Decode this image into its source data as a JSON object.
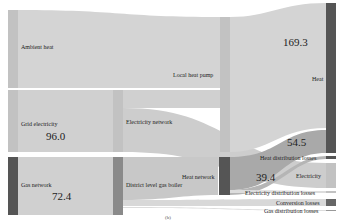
{
  "figure": {
    "caption": "(b)",
    "type": "sankey"
  },
  "colors": {
    "flow": "#d2d2d2",
    "flow_dark": "#a8a8a8",
    "node_light": "#c4c4c4",
    "node_dark": "#555555",
    "node_mid": "#8a8a8a",
    "background": "#ffffff"
  },
  "nodes": {
    "ambient_heat": {
      "label": "Ambient heat"
    },
    "grid_electricity": {
      "label": "Grid electricity",
      "value": "96.0"
    },
    "gas_network": {
      "label": "Gas network",
      "value": "72.4"
    },
    "electricity_network": {
      "label": "Electricity network"
    },
    "district_gas_boiler": {
      "label": "District level gas boiler"
    },
    "local_heat_pump": {
      "label": "Local heat pump"
    },
    "heat_network": {
      "label": "Heat network"
    },
    "heat": {
      "label": "Heat",
      "value": "169.3"
    },
    "heat_distribution_losses": {
      "label": "Heat distribution losses",
      "value": "54.5"
    },
    "electricity": {
      "label": "Electricity",
      "value": "39.4"
    },
    "electricity_distribution_losses": {
      "label": "Electricity distribution losses"
    },
    "conversion_losses": {
      "label": "Conversion losses"
    },
    "gas_distribution_losses": {
      "label": "Gas distribution losses"
    }
  },
  "values": {
    "heat": "169.3",
    "grid_electricity": "96.0",
    "gas_network": "72.4",
    "flow_54": "54.5",
    "flow_39": "39.4"
  }
}
